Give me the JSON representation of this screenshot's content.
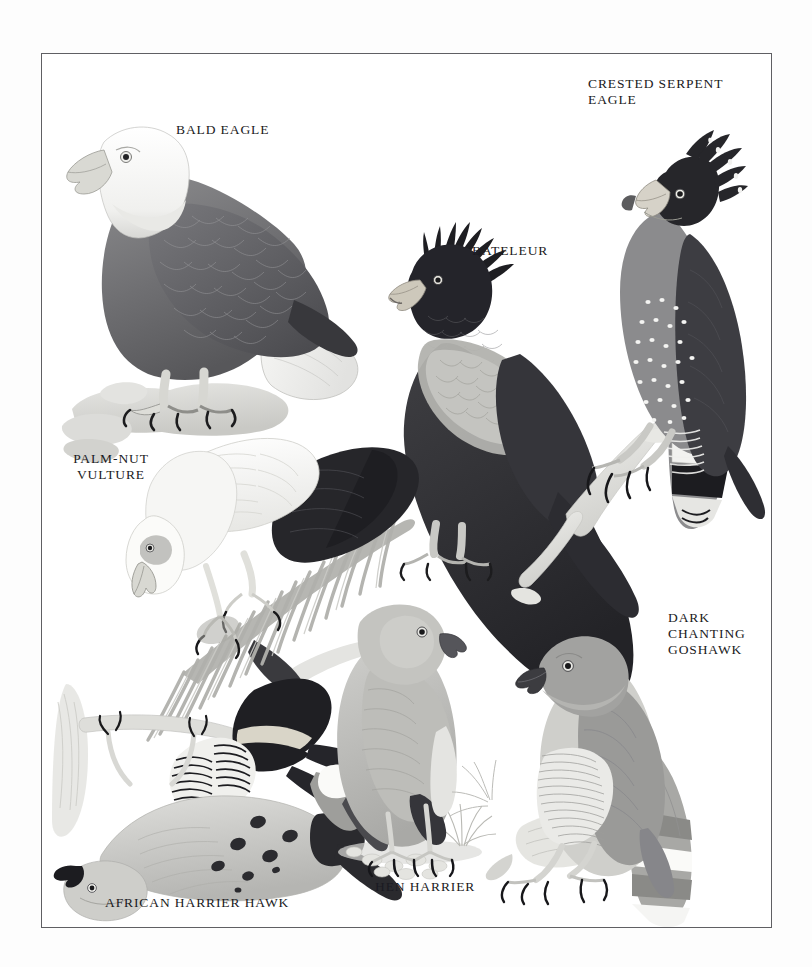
{
  "page": {
    "background_color": "#fdfdfd",
    "plate_background_color": "#ffffff",
    "border_color": "#5f5f63",
    "text_color": "#1a1a22",
    "kind": "natural-history illustration plate"
  },
  "labels": {
    "bald_eagle": "BALD EAGLE",
    "crested_serpent_eagle": "CRESTED SERPENT EAGLE",
    "bateleur": "BATELEUR",
    "palm_nut_vulture": "PALM-NUT\nVULTURE",
    "dark_chanting_goshawk": "DARK CHANTING\nGOSHAWK",
    "african_harrier_hawk": "AFRICAN HARRIER HAWK",
    "hen_harrier": "HEN HARRIER"
  },
  "birds": [
    {
      "name": "bald-eagle",
      "label": "BALD EAGLE",
      "pose": "perched on pale rock, facing left",
      "plumage": "white head and neck, dark brown body, white tail, yellow-grey bill",
      "body_color": "#6a6a6c",
      "head_color": "#f4f4f2"
    },
    {
      "name": "crested-serpent-eagle",
      "label": "CRESTED SERPENT EAGLE",
      "pose": "perched on pale branch, facing left",
      "plumage": "black crest, grey-brown body with white spots, black-and-white banded tail",
      "body_color": "#7b7b7d",
      "head_color": "#2a2a2c"
    },
    {
      "name": "bateleur",
      "label": "BATELEUR",
      "pose": "perched, facing left",
      "plumage": "very dark shaggy head and body, pale grey wing panel, short tail",
      "body_color": "#3a3a3c",
      "head_color": "#232326"
    },
    {
      "name": "palm-nut-vulture",
      "label": "PALM-NUT VULTURE",
      "pose": "leaning forward on a palm frond, head down, facing left",
      "plumage": "white head and body, black flight feathers",
      "body_color": "#f2f2f0",
      "head_color": "#fafaf8"
    },
    {
      "name": "african-harrier-hawk",
      "label": "AFRICAN HARRIER HAWK",
      "pose": "climbing on a trunk, wings spread, upside-down reaching head",
      "plumage": "grey body, barred black-and-white underparts, spotted wing coverts, black tail band",
      "body_color": "#b9b9b6",
      "head_color": "#cacac7"
    },
    {
      "name": "hen-harrier",
      "label": "HEN HARRIER",
      "pose": "standing on pebbly ground, facing right",
      "plumage": "pale grey overall, white rump, black wingtips",
      "body_color": "#bdbdba",
      "head_color": "#c6c6c3"
    },
    {
      "name": "dark-chanting-goshawk",
      "label": "DARK CHANTING GOSHAWK",
      "pose": "perched on a stump, facing left",
      "plumage": "grey head and back, finely barred white underparts, banded tail",
      "body_color": "#a9a9a6",
      "head_color": "#9e9e9c"
    }
  ]
}
